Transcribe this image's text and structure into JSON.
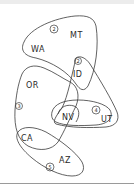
{
  "diagram": {
    "type": "hand-drawn hypergraph of US states",
    "nodes": [
      {
        "id": "WA",
        "label": "WA"
      },
      {
        "id": "MT",
        "label": "MT"
      },
      {
        "id": "ID",
        "label": "ID"
      },
      {
        "id": "OR",
        "label": "OR"
      },
      {
        "id": "NV",
        "label": "NV"
      },
      {
        "id": "UT",
        "label": "UT"
      },
      {
        "id": "CA",
        "label": "CA"
      },
      {
        "id": "AZ",
        "label": "AZ"
      }
    ],
    "groups": [
      {
        "number": "2",
        "members": [
          "WA",
          "MT",
          "ID"
        ]
      },
      {
        "number": "2",
        "members": [
          "ID",
          "NV",
          "UT"
        ]
      },
      {
        "number": "3",
        "members": [
          "OR",
          "CA",
          "NV",
          "ID"
        ]
      },
      {
        "number": "4",
        "members": [
          "NV",
          "UT"
        ]
      },
      {
        "number": "5",
        "members": [
          "CA",
          "AZ"
        ]
      }
    ]
  },
  "colors": {
    "stroke": "#3a3a3a",
    "text": "#2a2a2a",
    "background": "#ffffff",
    "top_strip": "#ececec",
    "bottom_rule": "#9a9a9a"
  }
}
